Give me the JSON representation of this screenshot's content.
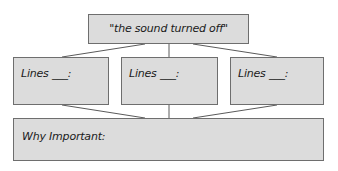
{
  "diagram": {
    "quote": "\"the sound turned off\"",
    "lines_boxes": [
      {
        "label": "Lines ___:"
      },
      {
        "label": "Lines ___:"
      },
      {
        "label": "Lines ___:"
      }
    ],
    "why_label": "Why Important:",
    "colors": {
      "box_fill": "#dcdcdc",
      "box_border": "#6e6e6e",
      "connector": "#5a5a5a"
    }
  }
}
